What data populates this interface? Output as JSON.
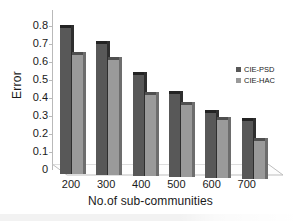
{
  "chart_data": {
    "type": "bar",
    "title": "",
    "xlabel": "No.of sub-communities",
    "ylabel": "Error",
    "categories": [
      "200",
      "300",
      "400",
      "500",
      "600",
      "700"
    ],
    "series": [
      {
        "name": "CIE-PSD",
        "color": "#585858",
        "values": [
          0.81,
          0.73,
          0.56,
          0.46,
          0.36,
          0.32
        ]
      },
      {
        "name": "CIE-HAC",
        "color": "#9a9a9a",
        "values": [
          0.66,
          0.64,
          0.45,
          0.4,
          0.32,
          0.21
        ]
      }
    ],
    "ylim": [
      0,
      0.8
    ],
    "yticks": [
      "0.8",
      "0.7",
      "0.6",
      "0.5",
      "0.4",
      "0.3",
      "0.2",
      "0.1",
      "0"
    ],
    "grid": false,
    "legend_position": "right"
  }
}
